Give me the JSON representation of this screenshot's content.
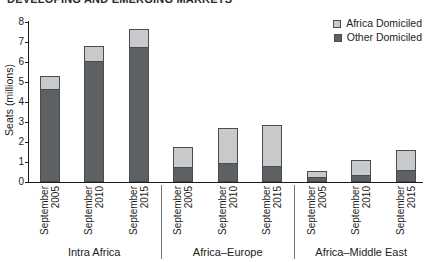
{
  "title_clipped": "DEVELOPING AND EMERGING MARKETS",
  "legend": [
    {
      "label": "Africa Domiciled",
      "color": "#c7c9cb"
    },
    {
      "label": "Other Domiciled",
      "color": "#5e6164"
    }
  ],
  "colors": {
    "africa_domiciled": "#c7c9cb",
    "other_domiciled": "#5e6164",
    "segment_border": "#4a4d50",
    "axis": "#1a1a1a",
    "separator": "#77797c"
  },
  "chart_data": {
    "type": "bar",
    "stacked": true,
    "title": "DEVELOPING AND EMERGING MARKETS",
    "xlabel": "",
    "ylabel": "Seats (millions)",
    "ylim": [
      0,
      8
    ],
    "yticks": [
      0,
      1,
      2,
      3,
      4,
      5,
      6,
      7,
      8
    ],
    "grid": false,
    "legend_position": "top-right",
    "groups": [
      {
        "label": "Intra Africa"
      },
      {
        "label": "Africa–Europe"
      },
      {
        "label": "Africa–Middle East"
      }
    ],
    "bar_labels": [
      [
        "September",
        "2005"
      ],
      [
        "September",
        "2010"
      ],
      [
        "September",
        "2015"
      ],
      [
        "September",
        "2005"
      ],
      [
        "September",
        "2010"
      ],
      [
        "September",
        "2015"
      ],
      [
        "September",
        "2005"
      ],
      [
        "September",
        "2010"
      ],
      [
        "September",
        "2015"
      ]
    ],
    "bar_group_index": [
      0,
      0,
      0,
      1,
      1,
      1,
      2,
      2,
      2
    ],
    "series": [
      {
        "name": "Other Domiciled",
        "color": "#5e6164",
        "values": [
          4.6,
          6.0,
          6.7,
          0.7,
          0.9,
          0.75,
          0.2,
          0.3,
          0.55
        ]
      },
      {
        "name": "Africa Domiciled",
        "color": "#c7c9cb",
        "values": [
          0.7,
          0.8,
          0.95,
          1.05,
          1.8,
          2.1,
          0.35,
          0.8,
          1.05
        ]
      }
    ],
    "totals": [
      5.3,
      6.8,
      7.65,
      1.75,
      2.7,
      2.85,
      0.55,
      1.1,
      1.6
    ]
  }
}
